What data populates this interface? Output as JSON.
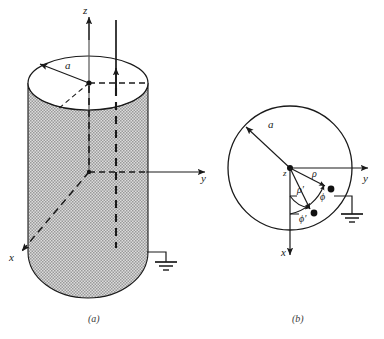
{
  "figure": {
    "background_color": "#ffffff",
    "ink_color": "#1a1a1a",
    "shading_color": "#c9c9c9"
  },
  "panels": [
    {
      "id": "panel-a",
      "caption": "(a)",
      "caption_x": 88,
      "caption_y": 322,
      "description": "Three-dimensional view of a shaded circular cylinder of radius a with axes x, y, z and a ground connection",
      "axes": [
        {
          "name": "z",
          "label": "z",
          "label_x": 83,
          "label_y": 14,
          "direction": "up"
        },
        {
          "name": "y",
          "label": "y",
          "label_x": 201,
          "label_y": 182,
          "direction": "right"
        },
        {
          "name": "x",
          "label": "x",
          "label_x": 9,
          "label_y": 261,
          "direction": "down-left"
        }
      ],
      "radius_label": "a",
      "radius_label_x": 65,
      "radius_label_y": 69,
      "ground_symbol": "earth-ground",
      "ground_x": 166,
      "ground_y": 262
    },
    {
      "id": "panel-b",
      "caption": "(b)",
      "caption_x": 292,
      "caption_y": 322,
      "description": "Top cross-sectional view of the cylinder showing source point and field point in polar coordinates",
      "axes": [
        {
          "name": "y",
          "label": "y",
          "label_x": 363,
          "label_y": 182,
          "direction": "right"
        },
        {
          "name": "x",
          "label": "x",
          "label_x": 281,
          "label_y": 256,
          "direction": "down"
        },
        {
          "name": "z",
          "label": "z",
          "label_x": 283,
          "label_y": 176,
          "direction": "out-of-page"
        }
      ],
      "radius_label": "a",
      "radius_label_x": 268,
      "radius_label_y": 128,
      "coordinate_labels": [
        {
          "name": "rho",
          "label": "ρ",
          "x": 312,
          "y": 177
        },
        {
          "name": "rho-prime",
          "label": "ρ′",
          "x": 298,
          "y": 192
        },
        {
          "name": "phi",
          "label": "ϕ",
          "x": 320,
          "y": 199
        },
        {
          "name": "phi-prime",
          "label": "ϕ′",
          "x": 300,
          "y": 221
        }
      ],
      "points": [
        {
          "name": "origin",
          "x": 290,
          "y": 168
        },
        {
          "name": "field-point",
          "x": 331,
          "y": 189
        },
        {
          "name": "source-point",
          "x": 314,
          "y": 213
        }
      ],
      "ground_symbol": "earth-ground",
      "ground_x": 352,
      "ground_y": 214
    }
  ]
}
